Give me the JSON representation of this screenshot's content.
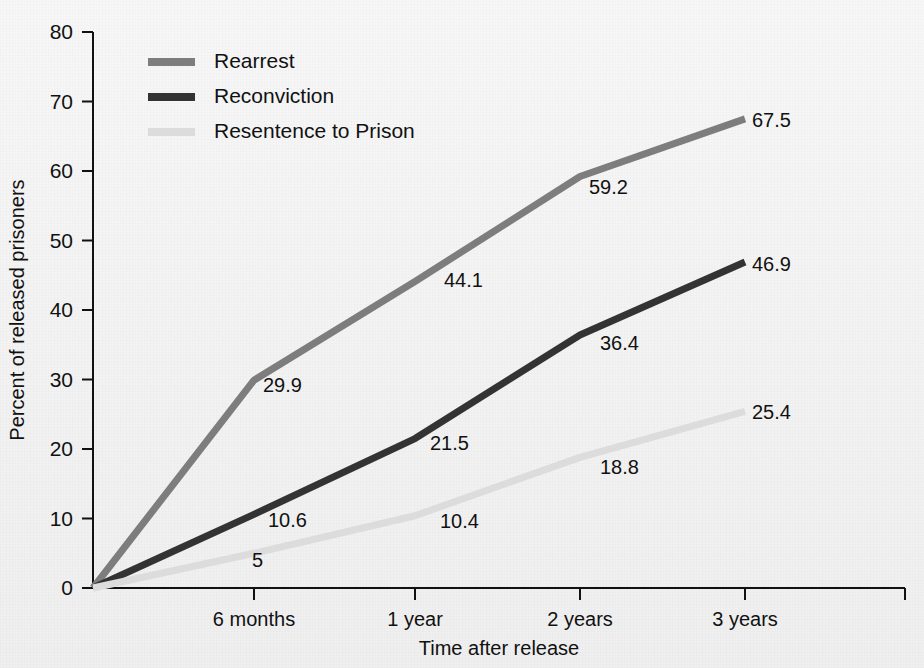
{
  "chart_data": {
    "type": "line",
    "title": "",
    "xlabel": "Time after release",
    "ylabel": "Percent of released prisoners",
    "categories": [
      "release",
      "6 months",
      "1 year",
      "2 years",
      "3 years"
    ],
    "x_tick_labels": [
      "6 months",
      "1 year",
      "2 years",
      "3 years"
    ],
    "y_tick_labels": [
      "0",
      "10",
      "20",
      "30",
      "40",
      "50",
      "60",
      "70",
      "80"
    ],
    "ylim": [
      0,
      80
    ],
    "ytick_step": 10,
    "grid": false,
    "legend_position": "top-left",
    "series": [
      {
        "name": "Rearrest",
        "color": "#7d7d7d",
        "values": [
          0,
          29.9,
          44.1,
          59.2,
          67.5
        ],
        "labels": [
          "",
          "29.9",
          "44.1",
          "59.2",
          "67.5"
        ]
      },
      {
        "name": "Reconviction",
        "color": "#333333",
        "values": [
          0,
          10.6,
          21.5,
          36.4,
          46.9
        ],
        "labels": [
          "",
          "10.6",
          "21.5",
          "36.4",
          "46.9"
        ]
      },
      {
        "name": "Resentence to Prison",
        "color": "#dcdcdc",
        "values": [
          0,
          5,
          10.4,
          18.8,
          25.4
        ],
        "labels": [
          "",
          "5",
          "10.4",
          "18.8",
          "25.4"
        ]
      }
    ],
    "point_labels": [
      {
        "text": "29.9",
        "series": "Rearrest",
        "x": 263,
        "y": 392
      },
      {
        "text": "44.1",
        "series": "Rearrest",
        "x": 444,
        "y": 287
      },
      {
        "text": "59.2",
        "series": "Rearrest",
        "x": 589,
        "y": 194
      },
      {
        "text": "67.5",
        "series": "Rearrest",
        "x": 752,
        "y": 127
      },
      {
        "text": "10.6",
        "series": "Reconviction",
        "x": 268,
        "y": 527
      },
      {
        "text": "21.5",
        "series": "Reconviction",
        "x": 430,
        "y": 450
      },
      {
        "text": "36.4",
        "series": "Reconviction",
        "x": 600,
        "y": 350
      },
      {
        "text": "46.9",
        "series": "Reconviction",
        "x": 752,
        "y": 271
      },
      {
        "text": "5",
        "series": "Resentence to Prison",
        "x": 252,
        "y": 567
      },
      {
        "text": "10.4",
        "series": "Resentence to Prison",
        "x": 440,
        "y": 528
      },
      {
        "text": "18.8",
        "series": "Resentence to Prison",
        "x": 600,
        "y": 474
      },
      {
        "text": "25.4",
        "series": "Resentence to Prison",
        "x": 752,
        "y": 419
      }
    ]
  },
  "legend": {
    "entries": [
      {
        "label": "Rearrest",
        "color": "#7d7d7d"
      },
      {
        "label": "Reconviction",
        "color": "#333333"
      },
      {
        "label": "Resentence to Prison",
        "color": "#dcdcdc"
      }
    ]
  },
  "colors": {
    "background": "#f4f4f4",
    "axis": "#111111",
    "text": "#1a1a1a",
    "rearrest": "#7d7d7d",
    "reconviction": "#333333",
    "resentence": "#dcdcdc"
  },
  "geometry": {
    "plot_left": 93,
    "plot_right": 905,
    "plot_top": 32,
    "plot_bottom": 588,
    "x_tick_positions": [
      254,
      415,
      580,
      745
    ],
    "series_x_positions": [
      93,
      254,
      415,
      580,
      745
    ]
  }
}
